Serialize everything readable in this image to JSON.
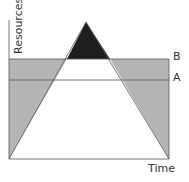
{
  "diagram": {
    "y_axis_label": "Resources",
    "x_axis_label": "Time",
    "levels": [
      {
        "label": "B",
        "y_pixel": 59
      },
      {
        "label": "A",
        "y_pixel": 80
      }
    ],
    "colors": {
      "shaded": "#b5b5b5",
      "peak": "#1e1e1e",
      "line": "#555555"
    }
  }
}
